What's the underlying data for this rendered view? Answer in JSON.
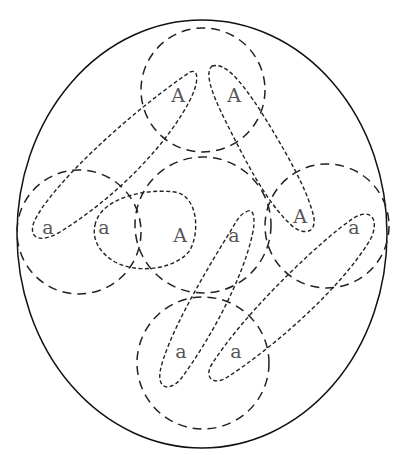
{
  "diagram": {
    "outer": {
      "cx": 202,
      "cy": 234,
      "rx": 185,
      "ry": 214
    },
    "circles": [
      {
        "name": "top",
        "cx": 203,
        "cy": 90,
        "r": 62
      },
      {
        "name": "left",
        "cx": 79,
        "cy": 232,
        "r": 62
      },
      {
        "name": "center",
        "cx": 203,
        "cy": 225,
        "r": 68
      },
      {
        "name": "right",
        "cx": 327,
        "cy": 226,
        "r": 62
      },
      {
        "name": "bottom",
        "cx": 203,
        "cy": 363,
        "r": 66
      }
    ],
    "labels": [
      {
        "text": "A",
        "x": 178,
        "y": 97
      },
      {
        "text": "A",
        "x": 234,
        "y": 97
      },
      {
        "text": "a",
        "x": 48,
        "y": 229
      },
      {
        "text": "a",
        "x": 104,
        "y": 229
      },
      {
        "text": "A",
        "x": 180,
        "y": 237
      },
      {
        "text": "a",
        "x": 234,
        "y": 237
      },
      {
        "text": "A",
        "x": 300,
        "y": 218
      },
      {
        "text": "a",
        "x": 354,
        "y": 229
      },
      {
        "text": "a",
        "x": 181,
        "y": 353
      },
      {
        "text": "a",
        "x": 236,
        "y": 353
      }
    ]
  }
}
